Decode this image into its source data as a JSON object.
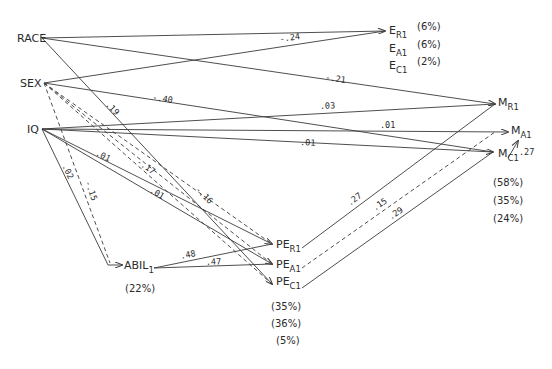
{
  "diagram": {
    "type": "path-diagram",
    "nodes": {
      "race": {
        "label": "RACE"
      },
      "sex": {
        "label": "SEX"
      },
      "iq": {
        "label": "IQ"
      },
      "abil": {
        "label": "ABIL",
        "sub": "1",
        "r2": "(22%)"
      },
      "pe_r": {
        "label": "PE",
        "sub": "R1"
      },
      "pe_a": {
        "label": "PE",
        "sub": "A1"
      },
      "pe_c": {
        "label": "PE",
        "sub": "C1"
      },
      "e_r": {
        "label": "E",
        "sub": "R1",
        "r2": "(6%)"
      },
      "e_a": {
        "label": "E",
        "sub": "A1",
        "r2": "(6%)"
      },
      "e_c": {
        "label": "E",
        "sub": "C1",
        "r2": "(2%)"
      },
      "m_r": {
        "label": "M",
        "sub": "R1"
      },
      "m_a": {
        "label": "M",
        "sub": "A1"
      },
      "m_c": {
        "label": "M",
        "sub": "C1"
      }
    },
    "pe_r2": [
      "(35%)",
      "(36%)",
      "(5%)"
    ],
    "m_r2": [
      "(58%)",
      "(35%)",
      "(24%)"
    ],
    "coefficients": {
      "sex_e": "-.24",
      "race_m": "-.21",
      "sex_mc": "-.40",
      "iq_mr": ".03",
      "iq_ma": ".01",
      "iq_mc": ".01",
      "race_pe": ".19",
      "iq_pe_r": ".01",
      "sex_pe_a": "-.17",
      "iq_pe_a": ".01",
      "sex_pe_c": "-.16",
      "iq_abil": ".02",
      "sex_abil": "-.15",
      "abil_pe_r": ".48",
      "abil_pe_a": ".47",
      "pe_r_mr": ".27",
      "pe_a_ma": ".15",
      "pe_c_mc": ".29",
      "mc_ma": ".27"
    }
  }
}
